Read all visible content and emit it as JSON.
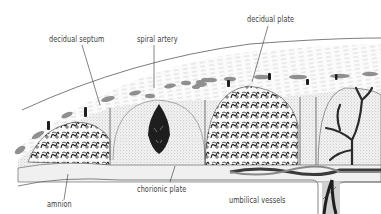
{
  "diagram": {
    "labels": [
      {
        "id": "decidual-septum",
        "text": "decidual septum"
      },
      {
        "id": "spiral-artery",
        "text": "spiral artery"
      },
      {
        "id": "decidual-plate",
        "text": "decidual plate"
      },
      {
        "id": "amnion",
        "text": "amnion"
      },
      {
        "id": "chorionic-plate",
        "text": "chorionic plate"
      },
      {
        "id": "umbilical-vessels",
        "text": "umbilical vessels"
      }
    ],
    "colors": {
      "line": "#333333",
      "dark_fill": "#1e1e1e",
      "gray_patch": "#8a8a8a",
      "stipple": "#9a9a9a",
      "background": "#ffffff"
    }
  }
}
